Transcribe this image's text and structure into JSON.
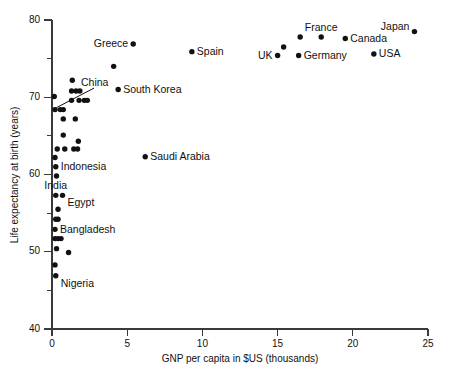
{
  "chart_data": {
    "type": "scatter",
    "title": "",
    "xlabel": "GNP per capita in $US (thousands)",
    "ylabel": "Life expectancy at birth (years)",
    "xlim": [
      0,
      25
    ],
    "ylim": [
      40,
      80
    ],
    "xticks": [
      0,
      5,
      10,
      15,
      20,
      25
    ],
    "xtick_labels": [
      "0",
      "5",
      "10",
      "15",
      "20",
      "25"
    ],
    "yticks": [
      40,
      50,
      60,
      70,
      80
    ],
    "ytick_labels": [
      "40",
      "50",
      "60",
      "70",
      "80"
    ],
    "yticks_minor": [
      45,
      55,
      65,
      75
    ],
    "grid": false,
    "legend": "none",
    "marker_color": "#111111",
    "axis_color": "#3a3a3a",
    "points": [
      {
        "x": 0.15,
        "y": 70.1,
        "label": "",
        "label_pos": "none"
      },
      {
        "x": 0.2,
        "y": 68.4,
        "label": "China",
        "label_pos": "leader"
      },
      {
        "x": 0.55,
        "y": 68.4,
        "label": "",
        "label_pos": "none"
      },
      {
        "x": 0.75,
        "y": 68.4,
        "label": "",
        "label_pos": "none"
      },
      {
        "x": 1.35,
        "y": 72.2,
        "label": "",
        "label_pos": "none"
      },
      {
        "x": 1.3,
        "y": 70.8,
        "label": "",
        "label_pos": "none"
      },
      {
        "x": 1.6,
        "y": 70.8,
        "label": "",
        "label_pos": "none"
      },
      {
        "x": 1.85,
        "y": 70.8,
        "label": "",
        "label_pos": "none"
      },
      {
        "x": 1.3,
        "y": 69.6,
        "label": "",
        "label_pos": "none"
      },
      {
        "x": 1.8,
        "y": 69.6,
        "label": "",
        "label_pos": "none"
      },
      {
        "x": 2.15,
        "y": 69.6,
        "label": "",
        "label_pos": "none"
      },
      {
        "x": 2.35,
        "y": 69.6,
        "label": "",
        "label_pos": "none"
      },
      {
        "x": 0.75,
        "y": 67.2,
        "label": "",
        "label_pos": "none"
      },
      {
        "x": 1.55,
        "y": 67.2,
        "label": "",
        "label_pos": "none"
      },
      {
        "x": 0.75,
        "y": 65.1,
        "label": "",
        "label_pos": "none"
      },
      {
        "x": 1.75,
        "y": 64.3,
        "label": "",
        "label_pos": "none"
      },
      {
        "x": 0.35,
        "y": 63.3,
        "label": "",
        "label_pos": "none"
      },
      {
        "x": 0.85,
        "y": 63.3,
        "label": "",
        "label_pos": "none"
      },
      {
        "x": 1.45,
        "y": 63.3,
        "label": "",
        "label_pos": "none"
      },
      {
        "x": 1.7,
        "y": 63.3,
        "label": "",
        "label_pos": "none"
      },
      {
        "x": 0.2,
        "y": 62.2,
        "label": "",
        "label_pos": "none"
      },
      {
        "x": 0.25,
        "y": 61.0,
        "label": "Indonesia",
        "label_pos": "right"
      },
      {
        "x": 0.3,
        "y": 59.8,
        "label": "",
        "label_pos": "none"
      },
      {
        "x": 0.25,
        "y": 57.3,
        "label": "India",
        "label_pos": "above"
      },
      {
        "x": 0.7,
        "y": 57.3,
        "label": "Egypt",
        "label_pos": "right-below"
      },
      {
        "x": 0.4,
        "y": 55.5,
        "label": "",
        "label_pos": "none"
      },
      {
        "x": 0.25,
        "y": 54.2,
        "label": "",
        "label_pos": "none"
      },
      {
        "x": 0.4,
        "y": 54.2,
        "label": "",
        "label_pos": "none"
      },
      {
        "x": 0.2,
        "y": 52.9,
        "label": "Bangladesh",
        "label_pos": "right"
      },
      {
        "x": 0.2,
        "y": 51.7,
        "label": "",
        "label_pos": "none"
      },
      {
        "x": 0.4,
        "y": 51.7,
        "label": "",
        "label_pos": "none"
      },
      {
        "x": 0.6,
        "y": 51.7,
        "label": "",
        "label_pos": "none"
      },
      {
        "x": 0.3,
        "y": 50.4,
        "label": "",
        "label_pos": "none"
      },
      {
        "x": 1.1,
        "y": 49.9,
        "label": "",
        "label_pos": "none"
      },
      {
        "x": 0.2,
        "y": 48.3,
        "label": "",
        "label_pos": "none"
      },
      {
        "x": 0.25,
        "y": 46.9,
        "label": "Nigeria",
        "label_pos": "right-below"
      },
      {
        "x": 4.1,
        "y": 74.0,
        "label": "",
        "label_pos": "none"
      },
      {
        "x": 4.4,
        "y": 71.0,
        "label": "South Korea",
        "label_pos": "right"
      },
      {
        "x": 5.4,
        "y": 76.9,
        "label": "Greece",
        "label_pos": "left"
      },
      {
        "x": 6.2,
        "y": 62.3,
        "label": "Saudi Arabia",
        "label_pos": "right"
      },
      {
        "x": 9.3,
        "y": 75.9,
        "label": "Spain",
        "label_pos": "right"
      },
      {
        "x": 15.0,
        "y": 75.4,
        "label": "UK",
        "label_pos": "left"
      },
      {
        "x": 15.4,
        "y": 76.5,
        "label": "",
        "label_pos": "none"
      },
      {
        "x": 16.4,
        "y": 75.4,
        "label": "Germany",
        "label_pos": "right"
      },
      {
        "x": 16.5,
        "y": 77.8,
        "label": "",
        "label_pos": "none"
      },
      {
        "x": 17.9,
        "y": 77.8,
        "label": "France",
        "label_pos": "above"
      },
      {
        "x": 19.5,
        "y": 77.6,
        "label": "Canada",
        "label_pos": "right"
      },
      {
        "x": 21.4,
        "y": 75.6,
        "label": "USA",
        "label_pos": "right"
      },
      {
        "x": 24.1,
        "y": 78.5,
        "label": "Japan",
        "label_pos": "left-above"
      }
    ]
  }
}
